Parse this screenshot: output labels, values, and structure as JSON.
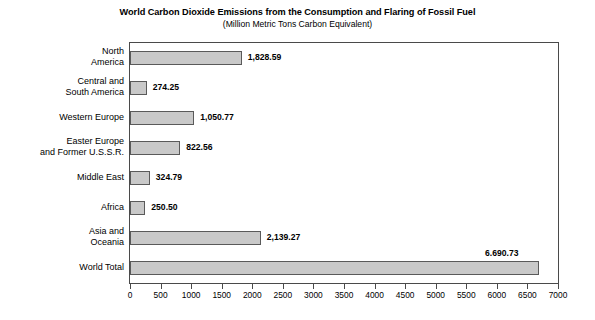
{
  "chart_data": {
    "type": "bar",
    "orientation": "horizontal",
    "title": "World Carbon Dioxide Emissions from the Consumption and Flaring of Fossil Fuel",
    "subtitle": "(Million Metric Tons Carbon Equivalent)",
    "xlabel": "",
    "ylabel": "",
    "xlim": [
      0,
      7000
    ],
    "xtick_step": 500,
    "grid": false,
    "legend": false,
    "bar_color": "#c9c9c9",
    "bar_border_color": "#5a5a5a",
    "categories": [
      "North\nAmerica",
      "Central and\nSouth America",
      "Western Europe",
      "Easter Europe\nand Former U.S.S.R.",
      "Middle East",
      "Africa",
      "Asia and\nOceania",
      "World Total"
    ],
    "values": [
      1828.59,
      274.25,
      1050.77,
      822.56,
      324.79,
      250.5,
      2139.27,
      6690.73
    ],
    "value_labels": [
      "1,828.59",
      "274.25",
      "1,050.77",
      "822.56",
      "324.79",
      "250.50",
      "2,139.27",
      "6.690.73"
    ],
    "xticks": [
      "0",
      "500",
      "1000",
      "1500",
      "2000",
      "2500",
      "3000",
      "3500",
      "4000",
      "4500",
      "5000",
      "5500",
      "6000",
      "6500",
      "7000"
    ]
  }
}
